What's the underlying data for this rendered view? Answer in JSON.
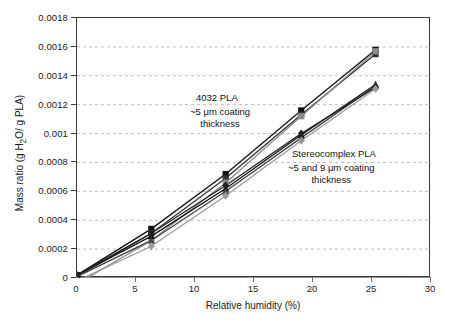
{
  "chart_data": {
    "type": "line",
    "title": "",
    "xlabel": "Relative humidity (%)",
    "ylabel": "Mass ratio (g H2O/ g PLA)",
    "ylabel_parts": {
      "pre": "Mass ratio (g H",
      "sub": "2",
      "post": "O/ g PLA)"
    },
    "xlim": [
      0,
      30
    ],
    "ylim": [
      0,
      0.0018
    ],
    "xticks": [
      0,
      5,
      10,
      15,
      20,
      25,
      30
    ],
    "xtick_labels": [
      "0",
      "5",
      "10",
      "15",
      "20",
      "25",
      "30"
    ],
    "yticks": [
      0,
      0.0002,
      0.0004,
      0.0006,
      0.0008,
      0.001,
      0.0012,
      0.0014,
      0.0016,
      0.0018
    ],
    "ytick_labels": [
      "0",
      "0.0002",
      "0.0004",
      "0.0006",
      "0.0008",
      "0.001",
      "0.0012",
      "0.0014",
      "0.0016",
      "0.0018"
    ],
    "grid": "horizontal-dashed",
    "legend": "none",
    "x": [
      0,
      6.3,
      12.6,
      19.0,
      25.3
    ],
    "series": [
      {
        "name": "4032 PLA ~5 um coating A",
        "group": "4032 PLA",
        "marker": "square",
        "color": "#111111",
        "values": [
          2e-05,
          0.00034,
          0.00072,
          0.00116,
          0.00158
        ]
      },
      {
        "name": "4032 PLA ~5 um coating B",
        "group": "4032 PLA",
        "marker": "square",
        "color": "#333333",
        "values": [
          1e-05,
          0.00031,
          0.00069,
          0.00113,
          0.00155
        ]
      },
      {
        "name": "4032 PLA ~5 um coating C",
        "group": "4032 PLA",
        "marker": "square",
        "color": "#8a8a8a",
        "values": [
          -4e-05,
          0.00026,
          0.00066,
          0.00112,
          0.00157
        ]
      },
      {
        "name": "Stereocomplex PLA ~5 um coating A",
        "group": "Stereocomplex PLA",
        "marker": "triangle",
        "color": "#111111",
        "values": [
          2e-05,
          0.00029,
          0.00062,
          0.00099,
          0.00134
        ]
      },
      {
        "name": "Stereocomplex PLA ~5 um coating B",
        "group": "Stereocomplex PLA",
        "marker": "triangle",
        "color": "#444444",
        "values": [
          1e-05,
          0.00026,
          0.0006,
          0.00097,
          0.00133
        ]
      },
      {
        "name": "Stereocomplex PLA ~9 um coating A",
        "group": "Stereocomplex PLA",
        "marker": "diamond",
        "color": "#222222",
        "values": [
          2e-05,
          0.00031,
          0.00064,
          0.001,
          0.00132
        ]
      },
      {
        "name": "Stereocomplex PLA ~9 um coating B",
        "group": "Stereocomplex PLA",
        "marker": "diamond",
        "color": "#9a9a9a",
        "values": [
          -2e-05,
          0.00022,
          0.00057,
          0.00095,
          0.00131
        ]
      }
    ],
    "annotations": [
      {
        "id": "annot-4032",
        "text": "4032 PLA"
      },
      {
        "id": "annot-4032b",
        "text": "~5 μm coating\nthickness",
        "line1": "~5 μm coating",
        "line2": "thickness"
      },
      {
        "id": "annot-sc",
        "text": "Stereocomplex PLA"
      },
      {
        "id": "annot-scb",
        "text": "~5 and 9 μm coating\nthickness",
        "line1": "~5 and 9 μm coating",
        "line2": "thickness"
      }
    ]
  },
  "annotations_text": {
    "group_a_title": "4032 PLA",
    "group_a_sub1": "~5 μm coating",
    "group_a_sub2": "thickness",
    "group_b_title": "Stereocomplex PLA",
    "group_b_sub1": "~5 and 9 μm coating",
    "group_b_sub2": "thickness"
  }
}
